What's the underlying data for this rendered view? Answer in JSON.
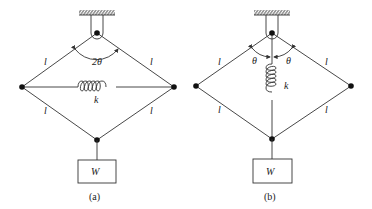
{
  "figures": [
    {
      "id": "a",
      "caption": "(a)",
      "spring_orientation": "horizontal",
      "angle_label": "2θ",
      "spring_label": "k",
      "member_labels": [
        "l",
        "l",
        "l",
        "l"
      ],
      "weight_label": "W"
    },
    {
      "id": "b",
      "caption": "(b)",
      "spring_orientation": "vertical",
      "angle_labels": [
        "θ",
        "θ"
      ],
      "spring_label": "k",
      "member_labels": [
        "l",
        "l",
        "l",
        "l"
      ],
      "weight_label": "W"
    }
  ],
  "colors": {
    "line": "#333333",
    "background": "#ffffff"
  }
}
